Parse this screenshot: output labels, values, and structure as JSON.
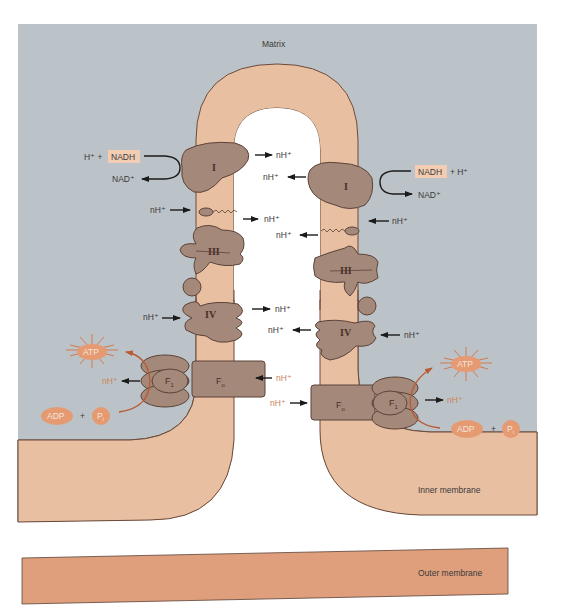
{
  "regions": {
    "matrix": "Matrix",
    "inner_membrane": "Inner membrane",
    "outer_membrane": "Outer membrane"
  },
  "complexes": {
    "complex_1": "I",
    "complex_3": "III",
    "complex_4": "IV",
    "f1": "F",
    "f1_sub": "1",
    "fo": "F",
    "fo_sub": "o"
  },
  "left_side": {
    "nadh_input_prefix": "H⁺ +",
    "nadh": "NADH",
    "nad_output": "NAD⁺",
    "proton_in_q": "nH⁺",
    "proton_in_iv": "nH⁺",
    "proton_out_f1": "nH⁺",
    "atp": "ATP",
    "adp": "ADP",
    "plus": "+",
    "pi": "P",
    "pi_sub": "i"
  },
  "intermembrane": {
    "proton_out_i_left": "nH⁺",
    "proton_in_i_right": "nH⁺",
    "proton_out_q_left": "nH⁺",
    "proton_in_q_right": "nH⁺",
    "proton_out_iv_left": "nH⁺",
    "proton_in_iv_right": "nH⁺",
    "proton_to_fo_left": "nH⁺",
    "proton_to_fo_right": "nH⁺"
  },
  "right_side": {
    "nadh": "NADH",
    "nadh_input_suffix": "+ H⁺",
    "nad_output": "NAD⁺",
    "proton_in_q": "nH⁺",
    "proton_in_iv": "nH⁺",
    "proton_out_f1": "nH⁺",
    "atp": "ATP",
    "adp": "ADP",
    "plus": "+",
    "pi": "P",
    "pi_sub": "i"
  },
  "colors": {
    "matrix_gray": "#bcc3c8",
    "membrane_peach": "#e9bfa2",
    "outer_membrane": "#df9f7d",
    "protein_brown": "#a4887a",
    "atp_orange": "#e59a72",
    "nadh_box": "#f2cdb3"
  }
}
